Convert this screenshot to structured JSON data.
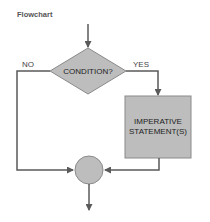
{
  "title": "Flowchart",
  "nodes": {
    "condition": {
      "label": "CONDITION?"
    },
    "statement": {
      "line1": "IMPERATIVE",
      "line2": "STATEMENT(S)"
    },
    "junction": {
      "label": ""
    }
  },
  "edges": {
    "no_label": "NO",
    "yes_label": "YES"
  },
  "colors": {
    "fill": "#bdbdbd",
    "stroke": "#666666",
    "line": "#5a5a5a"
  }
}
